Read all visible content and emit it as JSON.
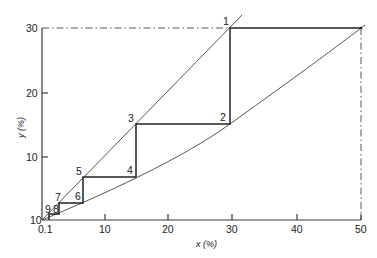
{
  "diagram": {
    "type": "mccabe-thiele-style staircase",
    "x_axis": {
      "title": "x (%)",
      "ticks": [
        {
          "label": "0.1",
          "value": 0
        },
        {
          "label": "10",
          "value": 10
        },
        {
          "label": "20",
          "value": 20
        },
        {
          "label": "30",
          "value": 30
        },
        {
          "label": "40",
          "value": 40
        },
        {
          "label": "50",
          "value": 50
        }
      ]
    },
    "y_axis": {
      "title": "y (%)",
      "ticks": [
        {
          "label": "10",
          "value": 0
        },
        {
          "label": "10",
          "value": 10
        },
        {
          "label": "20",
          "value": 20
        },
        {
          "label": "30",
          "value": 30
        }
      ]
    },
    "points": [
      {
        "label": "1",
        "x": 29.5,
        "y": 30
      },
      {
        "label": "2",
        "x": 29.5,
        "y": 15
      },
      {
        "label": "3",
        "x": 15,
        "y": 15
      },
      {
        "label": "4",
        "x": 15,
        "y": 6.8
      },
      {
        "label": "5",
        "x": 6.8,
        "y": 6.8
      },
      {
        "label": "6",
        "x": 6.8,
        "y": 2.6
      },
      {
        "label": "7",
        "x": 2.6,
        "y": 2.6
      },
      {
        "label": "8",
        "x": 2.6,
        "y": 0.9
      },
      {
        "label": "9",
        "x": 1.0,
        "y": 0.9
      }
    ],
    "reference_point": {
      "x": 50,
      "y": 30
    },
    "curves": [
      {
        "name": "operating-line",
        "description": "straight line from origin through point 1"
      },
      {
        "name": "equilibrium-curve",
        "description": "curve from origin to (50, 30)"
      }
    ],
    "guide_lines": [
      {
        "name": "y30-dashdot",
        "from": [
          0,
          30
        ],
        "to": [
          29.5,
          30
        ]
      },
      {
        "name": "x50-dashdot",
        "from": [
          50,
          30
        ],
        "to": [
          50,
          0
        ]
      }
    ]
  }
}
